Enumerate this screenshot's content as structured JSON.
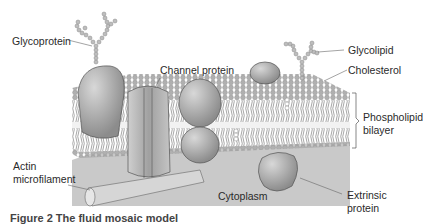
{
  "diagram": {
    "labels": {
      "glycoprotein": "Glycoprotein",
      "channel_protein": "Channel protein",
      "glycolipid": "Glycolipid",
      "cholesterol": "Cholesterol",
      "phospholipid_bilayer_1": "Phospholipid",
      "phospholipid_bilayer_2": "bilayer",
      "actin_1": "Actin",
      "actin_2": "microfilament",
      "cytoplasm": "Cytoplasm",
      "extrinsic_1": "Extrinsic",
      "extrinsic_2": "protein"
    },
    "caption": "Figure 2  The fluid mosaic model"
  },
  "colors": {
    "cytoplasm": "#c9c9c9",
    "head": "#a8a8a8",
    "protein": "#9e9e9e",
    "line": "#555555",
    "text": "#2a2a2a"
  }
}
